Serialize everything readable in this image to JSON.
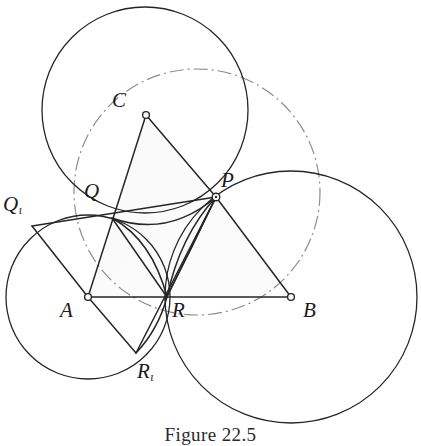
{
  "figure": {
    "caption": "Figure 22.5",
    "caption_position": {
      "top": 424
    },
    "background_color": "#ffffff",
    "stroke_color": "#262626",
    "dashdot_color": "#8d8d8d",
    "interior_fill": "#fbfbfb"
  },
  "labels": {
    "C": {
      "text": "C",
      "sub": "",
      "x": 112,
      "y": 90
    },
    "P": {
      "text": "P",
      "sub": "",
      "x": 221,
      "y": 170
    },
    "Q": {
      "text": "Q",
      "sub": "",
      "x": 84,
      "y": 181
    },
    "Q1": {
      "text": "Q",
      "sub": "ι",
      "x": 3,
      "y": 194
    },
    "A": {
      "text": "A",
      "sub": "",
      "x": 60,
      "y": 300
    },
    "R": {
      "text": "R",
      "sub": "",
      "x": 172,
      "y": 300
    },
    "B": {
      "text": "B",
      "sub": "",
      "x": 303,
      "y": 300
    },
    "R1": {
      "text": "R",
      "sub": "ι",
      "x": 137,
      "y": 361
    }
  },
  "points": {
    "A": {
      "x": 88,
      "y": 297
    },
    "B": {
      "x": 291,
      "y": 297
    },
    "C": {
      "x": 146,
      "y": 115
    },
    "P": {
      "x": 216,
      "y": 197
    },
    "Q": {
      "x": 112,
      "y": 218
    },
    "R": {
      "x": 167,
      "y": 297
    },
    "Q1": {
      "x": 32,
      "y": 226
    },
    "R1": {
      "x": 136,
      "y": 353
    }
  },
  "circles": {
    "circle_top_left": {
      "cx": 145,
      "cy": 110,
      "r": 103,
      "style": "solid"
    },
    "circle_bottom_left": {
      "cx": 88,
      "cy": 297,
      "r": 82,
      "style": "solid"
    },
    "circle_bottom_right": {
      "cx": 291,
      "cy": 297,
      "r": 126,
      "style": "solid"
    },
    "circumcircle": {
      "cx": 197,
      "cy": 192,
      "r": 123,
      "style": "dash-dot"
    }
  },
  "segments": [
    {
      "name": "segment-A-B",
      "from": "A",
      "to": "B"
    },
    {
      "name": "segment-A-C",
      "from": "A",
      "to": "C"
    },
    {
      "name": "segment-C-P",
      "from": "C",
      "to": "P"
    },
    {
      "name": "segment-P-B",
      "from": "P",
      "to": "B"
    },
    {
      "name": "segment-Q-P",
      "from": "Q",
      "to": "P"
    },
    {
      "name": "segment-Q1-P",
      "from": "Q1",
      "to": "P"
    },
    {
      "name": "segment-Q1-A",
      "from": "Q1",
      "to": "A"
    },
    {
      "name": "segment-A-R1",
      "from": "A",
      "to": "R1"
    },
    {
      "name": "segment-R1-P",
      "from": "R1",
      "to": "P"
    },
    {
      "name": "segment-R-P",
      "from": "R",
      "to": "P"
    }
  ],
  "arcs": [
    {
      "name": "arc-Q-to-P",
      "from": "Q",
      "to": "P"
    },
    {
      "name": "arc-Q-to-R",
      "from": "Q",
      "to": "R"
    },
    {
      "name": "arc-R-to-P",
      "from": "R",
      "to": "P"
    },
    {
      "name": "arc-R1-to-R",
      "from": "R1",
      "to": "R"
    }
  ]
}
